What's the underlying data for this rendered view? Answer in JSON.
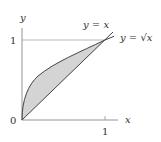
{
  "diagram": {
    "axes": {
      "x_label": "x",
      "y_label": "y",
      "origin_label": "0",
      "x_tick_label": "1",
      "y_tick_label": "1"
    },
    "curves": [
      {
        "name": "line",
        "label": "y = x"
      },
      {
        "name": "sqrt",
        "label": "y = √x"
      }
    ],
    "region": {
      "description": "shaded region between y = √x and y = x from 0 to 1",
      "fill": "#d4d4d4"
    },
    "colors": {
      "axis": "#888888",
      "curve": "#444444",
      "text": "#333333"
    }
  }
}
